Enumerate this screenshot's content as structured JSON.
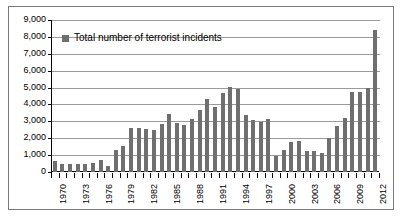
{
  "chart_data": {
    "type": "bar",
    "title": "",
    "xlabel": "",
    "ylabel": "",
    "ylim": [
      0,
      9000
    ],
    "ytick_step": 1000,
    "grid": true,
    "legend_position": "inside-top-left",
    "legend": [
      "Total number of terrorist incidents"
    ],
    "bar_color": "#6f6f6f",
    "gridline_color": "#9a9a9a",
    "axis_color": "#000000",
    "background_color": "#ffffff",
    "x_label_interval": 3,
    "ytick_labels": [
      "9,000",
      "8,000",
      "7,000",
      "6,000",
      "5,000",
      "4,000",
      "3,000",
      "2,000",
      "1,000",
      "0"
    ],
    "ytick_values": [
      9000,
      8000,
      7000,
      6000,
      5000,
      4000,
      3000,
      2000,
      1000,
      0
    ],
    "categories": [
      "1970",
      "1971",
      "1972",
      "1973",
      "1974",
      "1975",
      "1976",
      "1977",
      "1978",
      "1979",
      "1980",
      "1981",
      "1982",
      "1983",
      "1984",
      "1985",
      "1986",
      "1987",
      "1988",
      "1989",
      "1990",
      "1991",
      "1992",
      "1993",
      "1994",
      "1995",
      "1996",
      "1997",
      "1998",
      "1999",
      "2000",
      "2001",
      "2002",
      "2003",
      "2004",
      "2005",
      "2006",
      "2007",
      "2008",
      "2009",
      "2010",
      "2011",
      "2012"
    ],
    "values": [
      640,
      470,
      480,
      460,
      500,
      520,
      700,
      380,
      1280,
      1520,
      2620,
      2580,
      2540,
      2490,
      2860,
      3440,
      2890,
      2810,
      3120,
      3680,
      4300,
      3860,
      4660,
      5060,
      4900,
      3370,
      3070,
      2970,
      3120,
      920,
      1320,
      1780,
      1840,
      1250,
      1250,
      1150,
      2010,
      2720,
      3170,
      4720,
      4760,
      4990,
      8420
    ],
    "x_axis_labeled_years": [
      "1970",
      "1973",
      "1976",
      "1979",
      "1982",
      "1985",
      "1988",
      "1991",
      "1994",
      "1997",
      "2000",
      "2003",
      "2006",
      "2009",
      "2012"
    ]
  }
}
